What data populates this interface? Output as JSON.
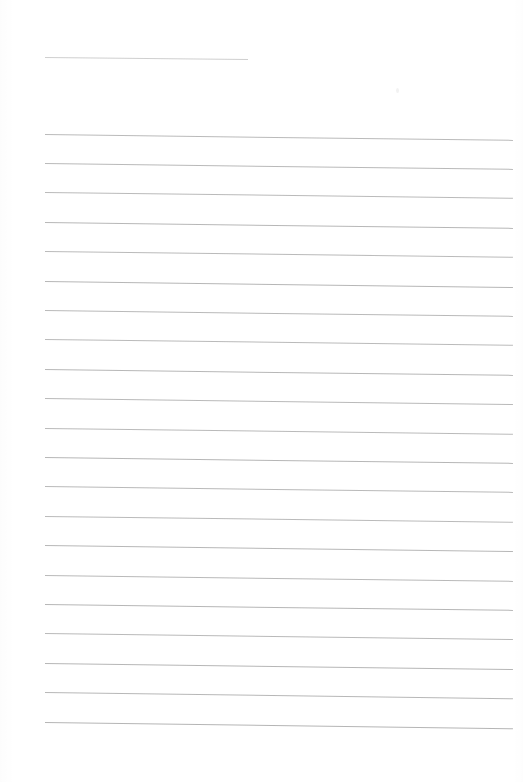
{
  "document": {
    "kind": "scanned-lined-paper",
    "title": "Blank ruled notebook page",
    "page_width": 523,
    "page_height": 782,
    "background_color": "#ffffff",
    "visible_text": "",
    "notes": "No text, headings, numbers or labels are present on the page."
  },
  "ruling": {
    "header_rule_color": "#bfbfbf",
    "body_rule_color": "#a9a9a9",
    "left_margin_x": 45,
    "right_edge_x": 513,
    "line_spacing": 29.4,
    "skew_degrees": 0.72,
    "line_count_total": 22,
    "body_line_count": 21
  },
  "lines": [
    {
      "name": "header-rule",
      "x": 45,
      "y": 57,
      "length": 203,
      "thickness": 0.9,
      "opacity": 0.75,
      "skew": 0.55
    },
    {
      "name": "body-line-1",
      "x": 45,
      "y": 133.5,
      "length": 468,
      "thickness": 1.0,
      "opacity": 0.8,
      "skew": 0.72
    },
    {
      "name": "body-line-2",
      "x": 45,
      "y": 163.0,
      "length": 468,
      "thickness": 1.0,
      "opacity": 0.82,
      "skew": 0.72
    },
    {
      "name": "body-line-3",
      "x": 45,
      "y": 192.4,
      "length": 468,
      "thickness": 1.0,
      "opacity": 0.8,
      "skew": 0.7
    },
    {
      "name": "body-line-4",
      "x": 45,
      "y": 221.8,
      "length": 468,
      "thickness": 1.0,
      "opacity": 0.84,
      "skew": 0.72
    },
    {
      "name": "body-line-5",
      "x": 45,
      "y": 251.2,
      "length": 468,
      "thickness": 1.0,
      "opacity": 0.8,
      "skew": 0.7
    },
    {
      "name": "body-line-6",
      "x": 45,
      "y": 280.6,
      "length": 468,
      "thickness": 1.0,
      "opacity": 0.85,
      "skew": 0.74
    },
    {
      "name": "body-line-7",
      "x": 45,
      "y": 310.0,
      "length": 468,
      "thickness": 1.0,
      "opacity": 0.82,
      "skew": 0.72
    },
    {
      "name": "body-line-8",
      "x": 45,
      "y": 339.4,
      "length": 468,
      "thickness": 1.0,
      "opacity": 0.8,
      "skew": 0.7
    },
    {
      "name": "body-line-9",
      "x": 45,
      "y": 368.8,
      "length": 468,
      "thickness": 1.0,
      "opacity": 0.84,
      "skew": 0.72
    },
    {
      "name": "body-line-10",
      "x": 45,
      "y": 398.2,
      "length": 468,
      "thickness": 1.0,
      "opacity": 0.82,
      "skew": 0.74
    },
    {
      "name": "body-line-11",
      "x": 45,
      "y": 427.6,
      "length": 468,
      "thickness": 1.0,
      "opacity": 0.8,
      "skew": 0.7
    },
    {
      "name": "body-line-12",
      "x": 45,
      "y": 457.0,
      "length": 468,
      "thickness": 1.0,
      "opacity": 0.85,
      "skew": 0.72
    },
    {
      "name": "body-line-13",
      "x": 45,
      "y": 486.4,
      "length": 468,
      "thickness": 1.0,
      "opacity": 0.82,
      "skew": 0.72
    },
    {
      "name": "body-line-14",
      "x": 45,
      "y": 515.8,
      "length": 468,
      "thickness": 1.0,
      "opacity": 0.8,
      "skew": 0.7
    },
    {
      "name": "body-line-15",
      "x": 45,
      "y": 545.2,
      "length": 468,
      "thickness": 1.0,
      "opacity": 0.84,
      "skew": 0.74
    },
    {
      "name": "body-line-16",
      "x": 45,
      "y": 574.6,
      "length": 468,
      "thickness": 1.0,
      "opacity": 0.82,
      "skew": 0.72
    },
    {
      "name": "body-line-17",
      "x": 45,
      "y": 604.0,
      "length": 468,
      "thickness": 1.0,
      "opacity": 0.85,
      "skew": 0.72
    },
    {
      "name": "body-line-18",
      "x": 45,
      "y": 633.4,
      "length": 468,
      "thickness": 1.0,
      "opacity": 0.82,
      "skew": 0.74
    },
    {
      "name": "body-line-19",
      "x": 45,
      "y": 662.8,
      "length": 468,
      "thickness": 1.0,
      "opacity": 0.85,
      "skew": 0.74
    },
    {
      "name": "body-line-20",
      "x": 45,
      "y": 692.2,
      "length": 468,
      "thickness": 1.0,
      "opacity": 0.84,
      "skew": 0.76
    },
    {
      "name": "body-line-21",
      "x": 45,
      "y": 721.6,
      "length": 468,
      "thickness": 1.0,
      "opacity": 0.86,
      "skew": 0.76
    }
  ],
  "artifacts": [
    {
      "name": "scan-speck",
      "x": 396,
      "y": 88
    }
  ]
}
